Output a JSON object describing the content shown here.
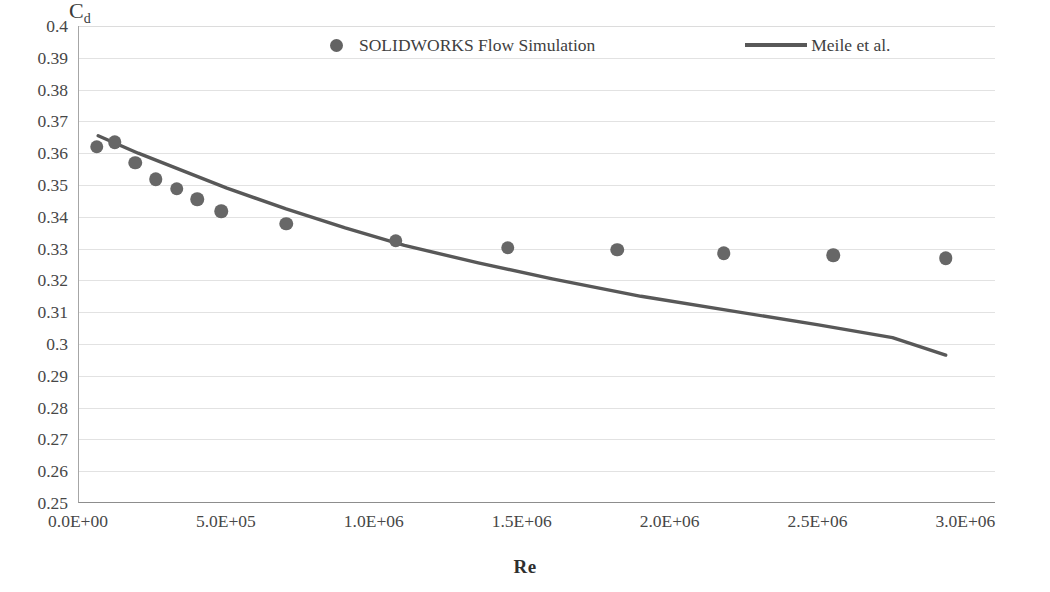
{
  "chart_data": {
    "type": "scatter",
    "title": "",
    "xlabel": "Re",
    "ylabel": "Cd",
    "ylabel_base": "C",
    "ylabel_sub": "d",
    "xlim": [
      0,
      3100000
    ],
    "ylim": [
      0.25,
      0.4
    ],
    "grid": true,
    "legend_position": "top",
    "x_ticks": [
      0,
      500000,
      1000000,
      1500000,
      2000000,
      2500000,
      3000000
    ],
    "x_tick_labels": [
      "0.0E+00",
      "5.0E+05",
      "1.0E+06",
      "1.5E+06",
      "2.0E+06",
      "2.5E+06",
      "3.0E+06"
    ],
    "y_ticks": [
      0.25,
      0.26,
      0.27,
      0.28,
      0.29,
      0.3,
      0.31,
      0.32,
      0.33,
      0.34,
      0.35,
      0.36,
      0.37,
      0.38,
      0.39,
      0.4
    ],
    "y_tick_labels": [
      "0.25",
      "0.26",
      "0.27",
      "0.28",
      "0.29",
      "0.3",
      "0.31",
      "0.32",
      "0.33",
      "0.34",
      "0.35",
      "0.36",
      "0.37",
      "0.38",
      "0.39",
      "0.4"
    ],
    "series": [
      {
        "name": "SOLIDWORKS Flow Simulation",
        "type": "scatter",
        "marker": "circle",
        "color": "#676767",
        "points": [
          {
            "x": 60000,
            "y": 0.362
          },
          {
            "x": 120000,
            "y": 0.3635
          },
          {
            "x": 190000,
            "y": 0.357
          },
          {
            "x": 260000,
            "y": 0.3518
          },
          {
            "x": 330000,
            "y": 0.3488
          },
          {
            "x": 400000,
            "y": 0.3455
          },
          {
            "x": 480000,
            "y": 0.3418
          },
          {
            "x": 700000,
            "y": 0.3378
          },
          {
            "x": 1070000,
            "y": 0.3325
          },
          {
            "x": 1450000,
            "y": 0.3303
          },
          {
            "x": 1820000,
            "y": 0.3297
          },
          {
            "x": 2180000,
            "y": 0.3285
          },
          {
            "x": 2550000,
            "y": 0.328
          },
          {
            "x": 2930000,
            "y": 0.327
          }
        ]
      },
      {
        "name": "Meile et al.",
        "type": "line",
        "color": "#585858",
        "points": [
          {
            "x": 65000,
            "y": 0.3655
          },
          {
            "x": 200000,
            "y": 0.36
          },
          {
            "x": 350000,
            "y": 0.3545
          },
          {
            "x": 500000,
            "y": 0.349
          },
          {
            "x": 700000,
            "y": 0.3425
          },
          {
            "x": 900000,
            "y": 0.3365
          },
          {
            "x": 1100000,
            "y": 0.331
          },
          {
            "x": 1350000,
            "y": 0.3255
          },
          {
            "x": 1600000,
            "y": 0.3205
          },
          {
            "x": 1900000,
            "y": 0.315
          },
          {
            "x": 2200000,
            "y": 0.3105
          },
          {
            "x": 2500000,
            "y": 0.306
          },
          {
            "x": 2750000,
            "y": 0.302
          },
          {
            "x": 2930000,
            "y": 0.2965
          }
        ]
      }
    ]
  },
  "legend": {
    "entries": [
      {
        "label": "SOLIDWORKS Flow Simulation",
        "marker": "circle-marker",
        "color": "#676767"
      },
      {
        "label": "Meile et al.",
        "marker": "line-marker",
        "color": "#585858"
      }
    ]
  },
  "axes": {
    "x_title": "Re",
    "y_title_base": "C",
    "y_title_sub": "d"
  }
}
